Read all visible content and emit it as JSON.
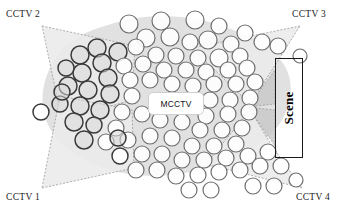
{
  "figure": {
    "width": 347,
    "height": 214,
    "background": "#ffffff"
  },
  "labels": {
    "cctv1": "CCTV 1",
    "cctv2": "CCTV 2",
    "cctv3": "CCTV 3",
    "cctv4": "CCTV 4",
    "mcctv": "MCCTV",
    "scene": "Scene"
  },
  "colors": {
    "node_stroke_dark": "#3a3a3a",
    "node_stroke_mid": "#6e6e6e",
    "node_fill": "#ffffff",
    "node_fill_shaded": "#d8d8d8",
    "cloud_fill": "#dcdcdc",
    "fov_fill": "#ebebeb",
    "fov_fill_dark": "#c8c8c8",
    "fov_stroke": "#8c8c8c",
    "scene_border": "#1a1a1a",
    "mcctv_border": "#cfcfcf",
    "text": "#1a1a1a"
  },
  "cameras": [
    {
      "id": "cctv2",
      "label": "CCTV 2",
      "apex": [
        42,
        26
      ],
      "corner": "top-left"
    },
    {
      "id": "cctv3",
      "label": "CCTV 3",
      "apex": [
        300,
        26
      ],
      "corner": "top-right"
    },
    {
      "id": "cctv1",
      "label": "CCTV 1",
      "apex": [
        42,
        188
      ],
      "corner": "bottom-left"
    },
    {
      "id": "cctv4",
      "label": "CCTV 4",
      "apex": [
        302,
        188
      ],
      "corner": "bottom-right"
    }
  ],
  "fov_cones": [
    {
      "camera": "cctv2",
      "points": "42,26 135,46 132,100 62,120"
    },
    {
      "camera": "cctv1",
      "points": "42,188 134,168 132,110 60,96"
    },
    {
      "camera": "cctv3",
      "points": "300,26 192,48 250,104 272,70"
    },
    {
      "camera": "cctv4",
      "points": "302,188 206,164 250,110 272,146"
    }
  ],
  "focus_triangles": [
    {
      "points": "248,107 275,70 275,104",
      "name": "scene-focus-upper"
    },
    {
      "points": "248,107 275,110 275,146",
      "name": "scene-focus-lower"
    }
  ],
  "cloud_path": "M118,22 C145,14 186,14 216,24 C248,34 268,46 282,62 C296,80 292,108 278,126 C262,148 232,162 200,170 C168,178 132,178 104,168 C76,158 54,142 46,120 C38,98 44,70 62,50 C80,32 98,28 118,22 Z",
  "nodes": [
    {
      "x": 129,
      "y": 24,
      "r": 9,
      "shade": "light"
    },
    {
      "x": 161,
      "y": 21,
      "r": 9,
      "shade": "light"
    },
    {
      "x": 195,
      "y": 20,
      "r": 9,
      "shade": "light"
    },
    {
      "x": 219,
      "y": 26,
      "r": 8,
      "shade": "light"
    },
    {
      "x": 245,
      "y": 33,
      "r": 8,
      "shade": "light"
    },
    {
      "x": 146,
      "y": 38,
      "r": 9,
      "shade": "light"
    },
    {
      "x": 170,
      "y": 37,
      "r": 9,
      "shade": "light"
    },
    {
      "x": 190,
      "y": 42,
      "r": 8,
      "shade": "light"
    },
    {
      "x": 208,
      "y": 40,
      "r": 9,
      "shade": "light"
    },
    {
      "x": 136,
      "y": 47,
      "r": 8,
      "shade": "light"
    },
    {
      "x": 231,
      "y": 44,
      "r": 8,
      "shade": "light"
    },
    {
      "x": 262,
      "y": 42,
      "r": 8,
      "shade": "light"
    },
    {
      "x": 97,
      "y": 48,
      "r": 9,
      "shade": "mid"
    },
    {
      "x": 118,
      "y": 52,
      "r": 9,
      "shade": "mid"
    },
    {
      "x": 156,
      "y": 55,
      "r": 8,
      "shade": "light"
    },
    {
      "x": 176,
      "y": 56,
      "r": 8,
      "shade": "light"
    },
    {
      "x": 198,
      "y": 58,
      "r": 8,
      "shade": "light"
    },
    {
      "x": 219,
      "y": 58,
      "r": 9,
      "shade": "light"
    },
    {
      "x": 240,
      "y": 56,
      "r": 8,
      "shade": "light"
    },
    {
      "x": 80,
      "y": 55,
      "r": 9,
      "shade": "mid"
    },
    {
      "x": 102,
      "y": 63,
      "r": 9,
      "shade": "mid"
    },
    {
      "x": 124,
      "y": 66,
      "r": 8,
      "shade": "light"
    },
    {
      "x": 143,
      "y": 64,
      "r": 8,
      "shade": "light"
    },
    {
      "x": 164,
      "y": 70,
      "r": 8,
      "shade": "light"
    },
    {
      "x": 186,
      "y": 70,
      "r": 8,
      "shade": "light"
    },
    {
      "x": 206,
      "y": 72,
      "r": 8,
      "shade": "light"
    },
    {
      "x": 228,
      "y": 70,
      "r": 8,
      "shade": "light"
    },
    {
      "x": 247,
      "y": 68,
      "r": 8,
      "shade": "light"
    },
    {
      "x": 82,
      "y": 73,
      "r": 9,
      "shade": "mid"
    },
    {
      "x": 66,
      "y": 68,
      "r": 8,
      "shade": "mid"
    },
    {
      "x": 108,
      "y": 78,
      "r": 9,
      "shade": "mid"
    },
    {
      "x": 130,
      "y": 80,
      "r": 8,
      "shade": "light"
    },
    {
      "x": 150,
      "y": 80,
      "r": 8,
      "shade": "light"
    },
    {
      "x": 172,
      "y": 84,
      "r": 8,
      "shade": "light"
    },
    {
      "x": 193,
      "y": 86,
      "r": 8,
      "shade": "light"
    },
    {
      "x": 214,
      "y": 84,
      "r": 8,
      "shade": "light"
    },
    {
      "x": 236,
      "y": 84,
      "r": 8,
      "shade": "light"
    },
    {
      "x": 255,
      "y": 82,
      "r": 8,
      "shade": "light"
    },
    {
      "x": 68,
      "y": 86,
      "r": 9,
      "shade": "mid"
    },
    {
      "x": 88,
      "y": 90,
      "r": 9,
      "shade": "mid"
    },
    {
      "x": 110,
      "y": 94,
      "r": 9,
      "shade": "mid"
    },
    {
      "x": 132,
      "y": 96,
      "r": 8,
      "shade": "light"
    },
    {
      "x": 210,
      "y": 100,
      "r": 8,
      "shade": "light"
    },
    {
      "x": 230,
      "y": 100,
      "r": 8,
      "shade": "light"
    },
    {
      "x": 250,
      "y": 98,
      "r": 8,
      "shade": "light"
    },
    {
      "x": 60,
      "y": 104,
      "r": 8,
      "shade": "mid"
    },
    {
      "x": 80,
      "y": 106,
      "r": 9,
      "shade": "mid"
    },
    {
      "x": 100,
      "y": 110,
      "r": 9,
      "shade": "mid"
    },
    {
      "x": 122,
      "y": 112,
      "r": 8,
      "shade": "light"
    },
    {
      "x": 142,
      "y": 114,
      "r": 8,
      "shade": "light"
    },
    {
      "x": 206,
      "y": 116,
      "r": 8,
      "shade": "light"
    },
    {
      "x": 228,
      "y": 114,
      "r": 8,
      "shade": "light"
    },
    {
      "x": 249,
      "y": 112,
      "r": 8,
      "shade": "light"
    },
    {
      "x": 41,
      "y": 112,
      "r": 8,
      "shade": "dark"
    },
    {
      "x": 74,
      "y": 122,
      "r": 9,
      "shade": "mid"
    },
    {
      "x": 94,
      "y": 125,
      "r": 8,
      "shade": "mid"
    },
    {
      "x": 116,
      "y": 128,
      "r": 8,
      "shade": "light"
    },
    {
      "x": 160,
      "y": 120,
      "r": 8,
      "shade": "light"
    },
    {
      "x": 182,
      "y": 122,
      "r": 8,
      "shade": "light"
    },
    {
      "x": 200,
      "y": 130,
      "r": 8,
      "shade": "light"
    },
    {
      "x": 222,
      "y": 130,
      "r": 8,
      "shade": "light"
    },
    {
      "x": 242,
      "y": 128,
      "r": 8,
      "shade": "light"
    },
    {
      "x": 84,
      "y": 140,
      "r": 9,
      "shade": "mid"
    },
    {
      "x": 106,
      "y": 142,
      "r": 8,
      "shade": "light"
    },
    {
      "x": 128,
      "y": 140,
      "r": 8,
      "shade": "light"
    },
    {
      "x": 150,
      "y": 136,
      "r": 8,
      "shade": "light"
    },
    {
      "x": 172,
      "y": 138,
      "r": 8,
      "shade": "light"
    },
    {
      "x": 192,
      "y": 146,
      "r": 8,
      "shade": "light"
    },
    {
      "x": 214,
      "y": 146,
      "r": 8,
      "shade": "light"
    },
    {
      "x": 236,
      "y": 144,
      "r": 8,
      "shade": "light"
    },
    {
      "x": 120,
      "y": 156,
      "r": 8,
      "shade": "dark"
    },
    {
      "x": 142,
      "y": 154,
      "r": 8,
      "shade": "light"
    },
    {
      "x": 162,
      "y": 154,
      "r": 8,
      "shade": "light"
    },
    {
      "x": 182,
      "y": 160,
      "r": 8,
      "shade": "light"
    },
    {
      "x": 204,
      "y": 160,
      "r": 8,
      "shade": "light"
    },
    {
      "x": 226,
      "y": 158,
      "r": 8,
      "shade": "light"
    },
    {
      "x": 248,
      "y": 156,
      "r": 8,
      "shade": "light"
    },
    {
      "x": 268,
      "y": 152,
      "r": 8,
      "shade": "light"
    },
    {
      "x": 136,
      "y": 170,
      "r": 8,
      "shade": "light"
    },
    {
      "x": 157,
      "y": 170,
      "r": 8,
      "shade": "light"
    },
    {
      "x": 176,
      "y": 176,
      "r": 8,
      "shade": "light"
    },
    {
      "x": 198,
      "y": 175,
      "r": 8,
      "shade": "light"
    },
    {
      "x": 219,
      "y": 172,
      "r": 8,
      "shade": "light"
    },
    {
      "x": 240,
      "y": 170,
      "r": 8,
      "shade": "light"
    },
    {
      "x": 260,
      "y": 166,
      "r": 8,
      "shade": "light"
    },
    {
      "x": 281,
      "y": 166,
      "r": 8,
      "shade": "light"
    },
    {
      "x": 189,
      "y": 190,
      "r": 8,
      "shade": "light"
    },
    {
      "x": 211,
      "y": 190,
      "r": 8,
      "shade": "light"
    },
    {
      "x": 253,
      "y": 186,
      "r": 8,
      "shade": "light"
    },
    {
      "x": 274,
      "y": 186,
      "r": 8,
      "shade": "light"
    },
    {
      "x": 296,
      "y": 180,
      "r": 7,
      "shade": "light"
    },
    {
      "x": 300,
      "y": 56,
      "r": 7,
      "shade": "light"
    },
    {
      "x": 278,
      "y": 46,
      "r": 8,
      "shade": "light"
    },
    {
      "x": 118,
      "y": 138,
      "r": 8,
      "shade": "mid"
    },
    {
      "x": 62,
      "y": 92,
      "r": 8,
      "shade": "mid"
    }
  ]
}
